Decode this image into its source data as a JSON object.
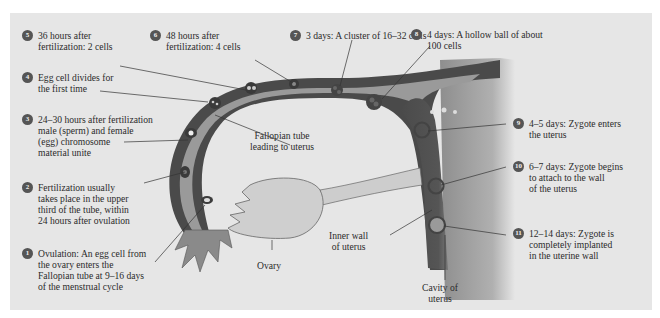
{
  "diagram": {
    "steps": [
      {
        "number": "1",
        "lines": [
          "Ovulation:  An egg cell from",
          "the ovary enters the",
          "Fallopian tube at 9–16 days",
          "of the menstrual cycle"
        ]
      },
      {
        "number": "2",
        "lines": [
          "Fertilization usually",
          "takes place in the upper",
          "third of the tube, within",
          "24 hours after ovulation"
        ]
      },
      {
        "number": "3",
        "lines": [
          "24–30 hours after fertilization",
          "male (sperm) and female",
          "(egg) chromosome",
          "material unite"
        ]
      },
      {
        "number": "4",
        "lines": [
          "Egg cell divides for",
          "the first time"
        ]
      },
      {
        "number": "5",
        "lines": [
          "36 hours after",
          "fertilization:  2 cells"
        ]
      },
      {
        "number": "6",
        "lines": [
          "48 hours after",
          "fertilization:  4 cells"
        ]
      },
      {
        "number": "7",
        "lines": [
          "3 days:  A cluster of 16–32 cells"
        ]
      },
      {
        "number": "8",
        "lines": [
          "4 days:  A hollow ball of about",
          "100 cells"
        ]
      },
      {
        "number": "9",
        "lines": [
          "4–5 days:  Zygote enters",
          "the uterus"
        ]
      },
      {
        "number": "10",
        "lines": [
          "6–7 days:  Zygote begins",
          "to attach to the wall",
          "of the uterus"
        ]
      },
      {
        "number": "11",
        "lines": [
          "12–14 days:  Zygote is",
          "completely implanted",
          "in the uterine wall"
        ]
      }
    ],
    "structures": {
      "fallopian_tube": [
        "Fallopian tube",
        "leading to uterus"
      ],
      "ovary": [
        "Ovary"
      ],
      "inner_wall": [
        "Inner wall",
        "of uterus"
      ],
      "cavity": [
        "Cavity of",
        "uterus"
      ]
    },
    "colors": {
      "background": "#e6e6e6",
      "tube_wall": "#4a4a4a",
      "tube_lumen": "#9a9a9a",
      "ovary": "#cfcfcf",
      "badge": "#555555",
      "uterus_wall": "#4d4d4d"
    }
  }
}
